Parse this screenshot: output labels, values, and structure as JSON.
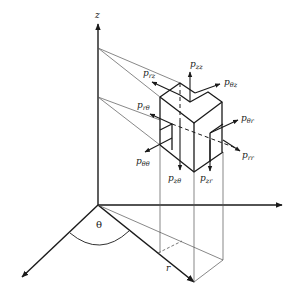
{
  "diagram": {
    "axes": {
      "z": "z",
      "theta": "θ",
      "r": "r"
    },
    "stress_labels": [
      {
        "id": "pzz",
        "base": "p",
        "sub": "zz"
      },
      {
        "id": "prz",
        "base": "p",
        "sub": "rz"
      },
      {
        "id": "pthz",
        "base": "p",
        "sub": "θz"
      },
      {
        "id": "prth",
        "base": "p",
        "sub": "rθ"
      },
      {
        "id": "pthr",
        "base": "p",
        "sub": "θr"
      },
      {
        "id": "pthth",
        "base": "p",
        "sub": "θθ"
      },
      {
        "id": "prr",
        "base": "p",
        "sub": "rr"
      },
      {
        "id": "pzth",
        "base": "p",
        "sub": "zθ"
      },
      {
        "id": "pzr",
        "base": "p",
        "sub": "zr"
      }
    ],
    "colors": {
      "ink": "#1a1a1a",
      "thin_line": "#555555",
      "background": "#ffffff"
    }
  }
}
